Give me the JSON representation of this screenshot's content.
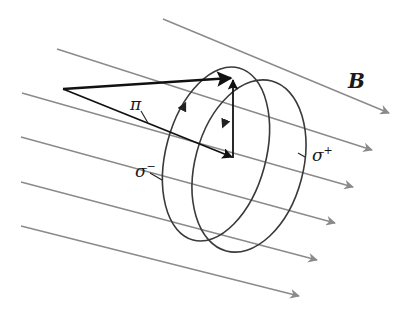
{
  "diagram": {
    "colors": {
      "field_lines": "#8a8a8a",
      "vectors": "#111111",
      "ellipses": "#444444",
      "text": "#1a1a1a"
    },
    "labels": {
      "field": "B",
      "pi": "π",
      "sigma_minus_base": "σ",
      "sigma_minus_sup": "−",
      "sigma_plus_base": "σ",
      "sigma_plus_sup": "+"
    },
    "field_lines": [
      {
        "x1": 163,
        "y1": 19,
        "x2": 389,
        "y2": 113
      },
      {
        "x1": 57,
        "y1": 49,
        "x2": 372,
        "y2": 150
      },
      {
        "x1": 22,
        "y1": 93,
        "x2": 353,
        "y2": 187
      },
      {
        "x1": 21,
        "y1": 137,
        "x2": 335,
        "y2": 223
      },
      {
        "x1": 21,
        "y1": 182,
        "x2": 317,
        "y2": 260
      },
      {
        "x1": 21,
        "y1": 226,
        "x2": 299,
        "y2": 296
      }
    ]
  }
}
